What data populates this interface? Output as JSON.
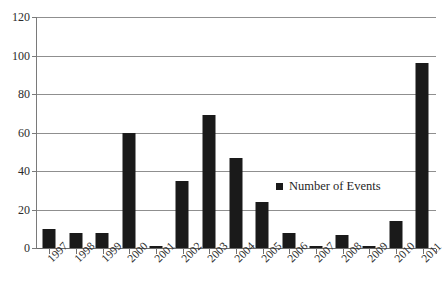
{
  "chart_data": {
    "type": "bar",
    "title": "",
    "subtitle": "",
    "xlabel": "",
    "ylabel": "",
    "categories": [
      "1997",
      "1998",
      "1999",
      "2000",
      "2001",
      "2002",
      "2003",
      "2004",
      "2005",
      "2006",
      "2007",
      "2008",
      "2009",
      "2010",
      "2011"
    ],
    "series": [
      {
        "name": "Number of Events",
        "values": [
          10,
          8,
          8,
          60,
          1,
          35,
          69,
          47,
          24,
          8,
          1,
          7,
          1,
          14,
          96
        ]
      }
    ],
    "ylim": [
      0,
      120
    ],
    "ytick_values": [
      0,
      20,
      40,
      60,
      80,
      100,
      120
    ],
    "ytick_labels": [
      "0",
      "20",
      "40",
      "60",
      "80",
      "100",
      "120"
    ],
    "grid": true,
    "grid_axis": "y",
    "legend_position": "inside-right",
    "bar_color": "#1a1a1a",
    "gridline_color": "#8f8f8f",
    "axis_color": "#7a7a7a",
    "background_color": "#ffffff",
    "xtick_rotation": -45
  },
  "legend": {
    "entries": [
      {
        "label": "Number of Events",
        "color": "#1a1a1a",
        "marker": "square-marker"
      }
    ]
  }
}
